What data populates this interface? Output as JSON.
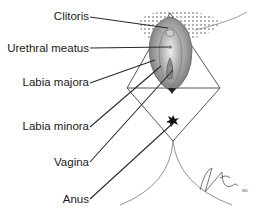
{
  "diagram": {
    "labels": [
      {
        "id": "clitoris",
        "text": "Clitoris",
        "right": 89,
        "top": 10,
        "line": [
          [
            90,
            17
          ],
          [
            168,
            28
          ]
        ]
      },
      {
        "id": "urethral-meatus",
        "text": "Urethral meatus",
        "right": 89,
        "top": 42,
        "line": [
          [
            90,
            48
          ],
          [
            168,
            47
          ]
        ]
      },
      {
        "id": "labia-majora",
        "text": "Labia majora",
        "right": 89,
        "top": 76,
        "line": [
          [
            90,
            83
          ],
          [
            155,
            60
          ]
        ]
      },
      {
        "id": "labia-minora",
        "text": "Labia minora",
        "right": 89,
        "top": 120,
        "line": [
          [
            90,
            127
          ],
          [
            160,
            66
          ]
        ]
      },
      {
        "id": "vagina",
        "text": "Vagina",
        "right": 89,
        "top": 156,
        "line": [
          [
            90,
            162
          ],
          [
            173,
            70
          ]
        ]
      },
      {
        "id": "anus",
        "text": "Anus",
        "right": 89,
        "top": 193,
        "line": [
          [
            90,
            199
          ],
          [
            173,
            124
          ]
        ]
      }
    ],
    "signature": "J. Brady, MD",
    "colors": {
      "line": "#2a2a2a",
      "outline": "#555555",
      "stipple": "#555555",
      "vulva_fill": "#a8a8a8",
      "vulva_dark": "#6e6e6e",
      "anus": "#111111"
    }
  }
}
